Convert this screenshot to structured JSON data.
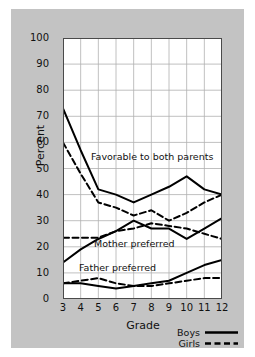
{
  "chart_data": {
    "type": "line",
    "title": "",
    "xlabel": "Grade",
    "ylabel": "Percent",
    "x": [
      3,
      4,
      5,
      6,
      7,
      8,
      9,
      10,
      11,
      12
    ],
    "xlim": [
      3,
      12
    ],
    "ylim": [
      0,
      100
    ],
    "ytick_labels": [
      "0",
      "10",
      "20",
      "30",
      "40",
      "50",
      "60",
      "70",
      "80",
      "90",
      "100"
    ],
    "xtick_labels": [
      "3",
      "4",
      "5",
      "6",
      "7",
      "8",
      "9",
      "10",
      "11",
      "12"
    ],
    "grid": true,
    "legend_position": "bottom-right",
    "annotations": [
      {
        "text": "Favorable to both parents",
        "x": 6.1,
        "y": 52
      },
      {
        "text": "Mother preferred",
        "x": 6.3,
        "y": 21.5
      },
      {
        "text": "Father preferred",
        "x": 5.5,
        "y": 12.5
      }
    ],
    "series": [
      {
        "name": "Favorable to both parents — Boys",
        "group": "Favorable to both parents",
        "style": "solid",
        "values": [
          73,
          57,
          42,
          40,
          37,
          40,
          43,
          47,
          42,
          40
        ]
      },
      {
        "name": "Favorable to both parents — Girls",
        "group": "Favorable to both parents",
        "style": "dashed",
        "values": [
          60,
          48,
          37,
          35,
          32,
          34,
          30,
          33,
          37,
          40
        ]
      },
      {
        "name": "Mother preferred — Boys",
        "group": "Mother preferred",
        "style": "solid",
        "values": [
          14,
          19,
          23,
          26,
          30,
          27,
          27,
          23,
          27,
          31
        ]
      },
      {
        "name": "Mother preferred — Girls",
        "group": "Mother preferred",
        "style": "dashed",
        "values": [
          23.5,
          23.5,
          23.5,
          26,
          27,
          29,
          28,
          27,
          25,
          23
        ]
      },
      {
        "name": "Father preferred — Boys",
        "group": "Father preferred",
        "style": "solid",
        "values": [
          6,
          6,
          5,
          4,
          5,
          6,
          7,
          10,
          13,
          15
        ]
      },
      {
        "name": "Father preferred — Girls",
        "group": "Father preferred",
        "style": "dashed",
        "values": [
          6,
          7,
          8,
          6,
          5,
          5,
          6,
          7,
          8,
          8
        ]
      }
    ],
    "legend": [
      {
        "label": "Boys",
        "style": "solid"
      },
      {
        "label": "Girls",
        "style": "dashed"
      }
    ],
    "colors": {
      "line": "#000000",
      "background": "#c3c3c3",
      "plot_background": "#ffffff",
      "grid": "#b0b0b0"
    }
  }
}
